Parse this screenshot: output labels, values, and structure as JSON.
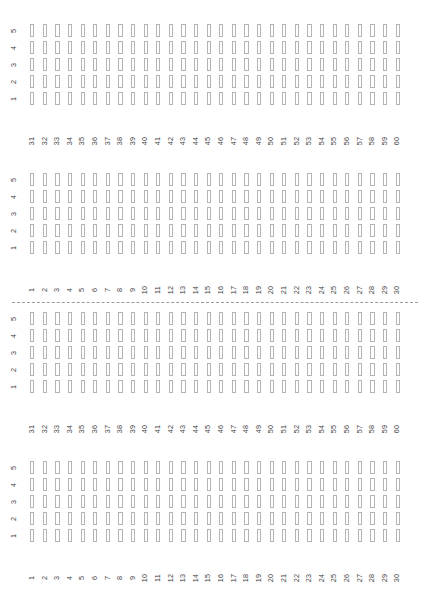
{
  "figure": {
    "width": 424,
    "height": 594,
    "background": "#ffffff",
    "glyph_border_color": "#b4b4b4",
    "axis_text_color": "#404040",
    "separator_color": "#9a9a9a",
    "separator_style": "dashed"
  },
  "chart_data": {
    "type": "heatmap",
    "title": "",
    "subtitle": "",
    "xlabel": "",
    "ylabel": "",
    "grid": false,
    "legend": "none",
    "glyph": "empty-rectangle",
    "note": "Four stacked facet panels; each panel is a 30-column x 5-row lattice of empty rectangle glyphs (all cells unfilled / zero value).",
    "panels": [
      {
        "index": 0,
        "x_tick_labels": [
          "31",
          "32",
          "33",
          "34",
          "35",
          "36",
          "37",
          "38",
          "39",
          "40",
          "41",
          "42",
          "43",
          "44",
          "45",
          "46",
          "47",
          "48",
          "49",
          "50",
          "51",
          "52",
          "53",
          "54",
          "55",
          "56",
          "57",
          "58",
          "59",
          "60"
        ],
        "y_tick_labels": [
          "5",
          "4",
          "3",
          "2",
          "1"
        ],
        "xlim": [
          31,
          60
        ],
        "ylim": [
          1,
          5
        ],
        "values": [
          [
            0,
            0,
            0,
            0,
            0,
            0,
            0,
            0,
            0,
            0,
            0,
            0,
            0,
            0,
            0,
            0,
            0,
            0,
            0,
            0,
            0,
            0,
            0,
            0,
            0,
            0,
            0,
            0,
            0,
            0
          ],
          [
            0,
            0,
            0,
            0,
            0,
            0,
            0,
            0,
            0,
            0,
            0,
            0,
            0,
            0,
            0,
            0,
            0,
            0,
            0,
            0,
            0,
            0,
            0,
            0,
            0,
            0,
            0,
            0,
            0,
            0
          ],
          [
            0,
            0,
            0,
            0,
            0,
            0,
            0,
            0,
            0,
            0,
            0,
            0,
            0,
            0,
            0,
            0,
            0,
            0,
            0,
            0,
            0,
            0,
            0,
            0,
            0,
            0,
            0,
            0,
            0,
            0
          ],
          [
            0,
            0,
            0,
            0,
            0,
            0,
            0,
            0,
            0,
            0,
            0,
            0,
            0,
            0,
            0,
            0,
            0,
            0,
            0,
            0,
            0,
            0,
            0,
            0,
            0,
            0,
            0,
            0,
            0,
            0
          ],
          [
            0,
            0,
            0,
            0,
            0,
            0,
            0,
            0,
            0,
            0,
            0,
            0,
            0,
            0,
            0,
            0,
            0,
            0,
            0,
            0,
            0,
            0,
            0,
            0,
            0,
            0,
            0,
            0,
            0,
            0
          ]
        ]
      },
      {
        "index": 1,
        "x_tick_labels": [
          "1",
          "2",
          "3",
          "4",
          "5",
          "6",
          "7",
          "8",
          "9",
          "10",
          "11",
          "12",
          "13",
          "14",
          "15",
          "16",
          "17",
          "18",
          "19",
          "20",
          "21",
          "22",
          "23",
          "24",
          "25",
          "26",
          "27",
          "28",
          "29",
          "30"
        ],
        "y_tick_labels": [
          "5",
          "4",
          "3",
          "2",
          "1"
        ],
        "xlim": [
          1,
          30
        ],
        "ylim": [
          1,
          5
        ],
        "values": [
          [
            0,
            0,
            0,
            0,
            0,
            0,
            0,
            0,
            0,
            0,
            0,
            0,
            0,
            0,
            0,
            0,
            0,
            0,
            0,
            0,
            0,
            0,
            0,
            0,
            0,
            0,
            0,
            0,
            0,
            0
          ],
          [
            0,
            0,
            0,
            0,
            0,
            0,
            0,
            0,
            0,
            0,
            0,
            0,
            0,
            0,
            0,
            0,
            0,
            0,
            0,
            0,
            0,
            0,
            0,
            0,
            0,
            0,
            0,
            0,
            0,
            0
          ],
          [
            0,
            0,
            0,
            0,
            0,
            0,
            0,
            0,
            0,
            0,
            0,
            0,
            0,
            0,
            0,
            0,
            0,
            0,
            0,
            0,
            0,
            0,
            0,
            0,
            0,
            0,
            0,
            0,
            0,
            0
          ],
          [
            0,
            0,
            0,
            0,
            0,
            0,
            0,
            0,
            0,
            0,
            0,
            0,
            0,
            0,
            0,
            0,
            0,
            0,
            0,
            0,
            0,
            0,
            0,
            0,
            0,
            0,
            0,
            0,
            0,
            0
          ],
          [
            0,
            0,
            0,
            0,
            0,
            0,
            0,
            0,
            0,
            0,
            0,
            0,
            0,
            0,
            0,
            0,
            0,
            0,
            0,
            0,
            0,
            0,
            0,
            0,
            0,
            0,
            0,
            0,
            0,
            0
          ]
        ]
      },
      {
        "index": 2,
        "x_tick_labels": [
          "31",
          "32",
          "33",
          "34",
          "35",
          "36",
          "37",
          "38",
          "39",
          "40",
          "41",
          "42",
          "43",
          "44",
          "45",
          "46",
          "47",
          "48",
          "49",
          "50",
          "51",
          "52",
          "53",
          "54",
          "55",
          "56",
          "57",
          "58",
          "59",
          "60"
        ],
        "y_tick_labels": [
          "5",
          "4",
          "3",
          "2",
          "1"
        ],
        "xlim": [
          31,
          60
        ],
        "ylim": [
          1,
          5
        ],
        "values": [
          [
            0,
            0,
            0,
            0,
            0,
            0,
            0,
            0,
            0,
            0,
            0,
            0,
            0,
            0,
            0,
            0,
            0,
            0,
            0,
            0,
            0,
            0,
            0,
            0,
            0,
            0,
            0,
            0,
            0,
            0
          ],
          [
            0,
            0,
            0,
            0,
            0,
            0,
            0,
            0,
            0,
            0,
            0,
            0,
            0,
            0,
            0,
            0,
            0,
            0,
            0,
            0,
            0,
            0,
            0,
            0,
            0,
            0,
            0,
            0,
            0,
            0
          ],
          [
            0,
            0,
            0,
            0,
            0,
            0,
            0,
            0,
            0,
            0,
            0,
            0,
            0,
            0,
            0,
            0,
            0,
            0,
            0,
            0,
            0,
            0,
            0,
            0,
            0,
            0,
            0,
            0,
            0,
            0
          ],
          [
            0,
            0,
            0,
            0,
            0,
            0,
            0,
            0,
            0,
            0,
            0,
            0,
            0,
            0,
            0,
            0,
            0,
            0,
            0,
            0,
            0,
            0,
            0,
            0,
            0,
            0,
            0,
            0,
            0,
            0
          ],
          [
            0,
            0,
            0,
            0,
            0,
            0,
            0,
            0,
            0,
            0,
            0,
            0,
            0,
            0,
            0,
            0,
            0,
            0,
            0,
            0,
            0,
            0,
            0,
            0,
            0,
            0,
            0,
            0,
            0,
            0
          ]
        ]
      },
      {
        "index": 3,
        "x_tick_labels": [
          "1",
          "2",
          "3",
          "4",
          "5",
          "6",
          "7",
          "8",
          "9",
          "10",
          "11",
          "12",
          "13",
          "14",
          "15",
          "16",
          "17",
          "18",
          "19",
          "20",
          "21",
          "22",
          "23",
          "24",
          "25",
          "26",
          "27",
          "28",
          "29",
          "30"
        ],
        "y_tick_labels": [
          "5",
          "4",
          "3",
          "2",
          "1"
        ],
        "xlim": [
          1,
          30
        ],
        "ylim": [
          1,
          5
        ],
        "values": [
          [
            0,
            0,
            0,
            0,
            0,
            0,
            0,
            0,
            0,
            0,
            0,
            0,
            0,
            0,
            0,
            0,
            0,
            0,
            0,
            0,
            0,
            0,
            0,
            0,
            0,
            0,
            0,
            0,
            0,
            0
          ],
          [
            0,
            0,
            0,
            0,
            0,
            0,
            0,
            0,
            0,
            0,
            0,
            0,
            0,
            0,
            0,
            0,
            0,
            0,
            0,
            0,
            0,
            0,
            0,
            0,
            0,
            0,
            0,
            0,
            0,
            0
          ],
          [
            0,
            0,
            0,
            0,
            0,
            0,
            0,
            0,
            0,
            0,
            0,
            0,
            0,
            0,
            0,
            0,
            0,
            0,
            0,
            0,
            0,
            0,
            0,
            0,
            0,
            0,
            0,
            0,
            0,
            0
          ],
          [
            0,
            0,
            0,
            0,
            0,
            0,
            0,
            0,
            0,
            0,
            0,
            0,
            0,
            0,
            0,
            0,
            0,
            0,
            0,
            0,
            0,
            0,
            0,
            0,
            0,
            0,
            0,
            0,
            0,
            0
          ],
          [
            0,
            0,
            0,
            0,
            0,
            0,
            0,
            0,
            0,
            0,
            0,
            0,
            0,
            0,
            0,
            0,
            0,
            0,
            0,
            0,
            0,
            0,
            0,
            0,
            0,
            0,
            0,
            0,
            0,
            0
          ]
        ]
      }
    ],
    "separators": [
      {
        "after_panel": 1
      }
    ]
  },
  "layout": {
    "panel_tops": [
      22,
      171,
      310,
      459
    ],
    "panel_height": 108,
    "row_height": 17,
    "separator_top": 302
  }
}
